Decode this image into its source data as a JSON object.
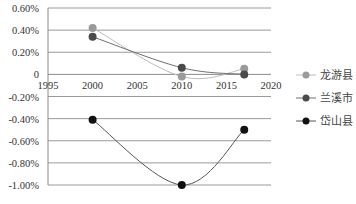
{
  "chart_data": {
    "type": "line",
    "title": "",
    "xlabel": "",
    "ylabel": "",
    "x_ticks": [
      1995,
      2000,
      2005,
      2010,
      2015,
      2020
    ],
    "x_tick_labels": [
      "1995",
      "2000",
      "2005",
      "2010",
      "2015",
      "2020"
    ],
    "y_ticks": [
      0.6,
      0.4,
      0.2,
      0,
      -0.2,
      -0.4,
      -0.6,
      -0.8,
      -1.0
    ],
    "y_tick_labels": [
      "0.60%",
      "0.40%",
      "0.20%",
      "0",
      "-0.20%",
      "-0.40%",
      "-0.60%",
      "-0.80%",
      "-1.00%"
    ],
    "xlim": [
      1995,
      2020
    ],
    "ylim": [
      -1.0,
      0.6
    ],
    "grid": true,
    "legend_position": "right",
    "x": [
      2000,
      2010,
      2017
    ],
    "series": [
      {
        "name": "龙游县",
        "values": [
          0.42,
          -0.02,
          0.05
        ],
        "marker_color": "#9a9a9a",
        "line_color": "#bdbdbd"
      },
      {
        "name": "兰溪市",
        "values": [
          0.34,
          0.06,
          0.0
        ],
        "marker_color": "#4a4a4a",
        "line_color": "#6e6e6e"
      },
      {
        "name": "岱山县",
        "values": [
          -0.41,
          -1.0,
          -0.5
        ],
        "marker_color": "#111111",
        "line_color": "#555555"
      }
    ]
  },
  "legend": {
    "items": [
      {
        "label": "龙游县"
      },
      {
        "label": "兰溪市"
      },
      {
        "label": "岱山县"
      }
    ]
  }
}
